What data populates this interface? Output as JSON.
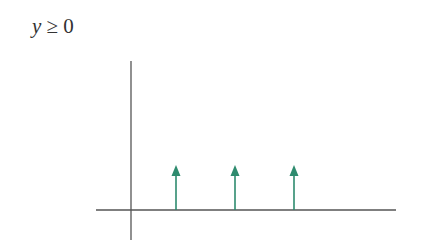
{
  "label": {
    "variable": "y",
    "relation": "≥",
    "value": "0"
  },
  "colors": {
    "axis": "#555555",
    "arrow": "#2e8b6e"
  },
  "chart_data": {
    "type": "impulse",
    "title": "y ≥ 0",
    "xlabel": "",
    "ylabel": "",
    "impulses": [
      {
        "x": 1,
        "y": 1
      },
      {
        "x": 2,
        "y": 1
      },
      {
        "x": 3,
        "y": 1
      }
    ],
    "grid": false,
    "legend": null
  }
}
